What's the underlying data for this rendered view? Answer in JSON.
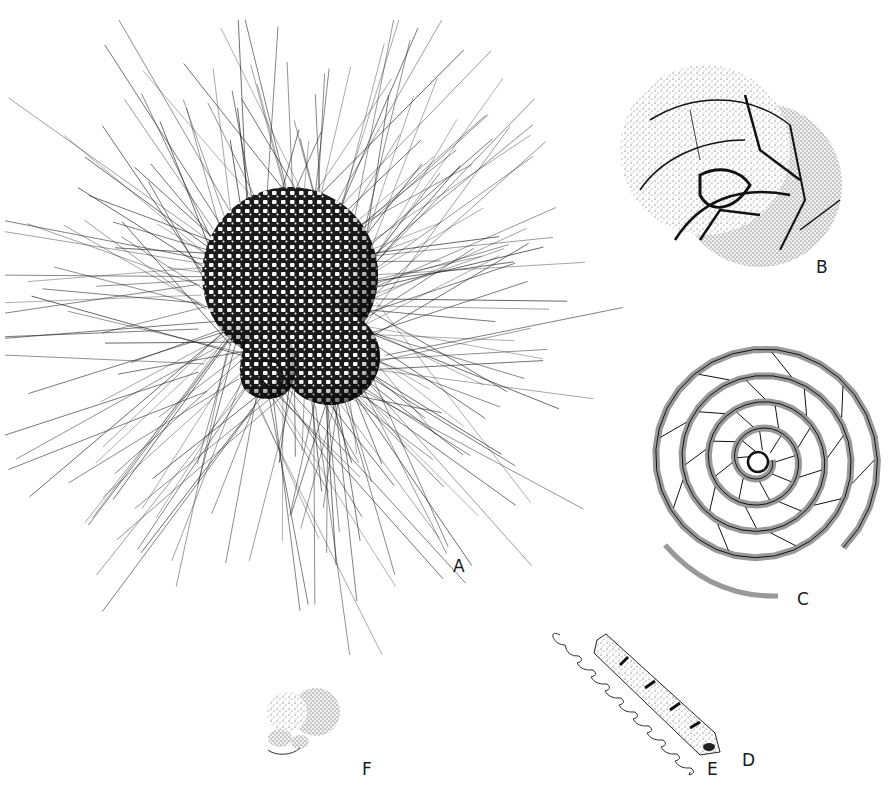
{
  "plate": {
    "description": "Plate of foraminifera illustrations",
    "ink_color": "#1a1a1a",
    "background": "#ffffff"
  },
  "figures": [
    {
      "id": "A",
      "label": "A",
      "subject": "spinose planktonic foraminifer with radiating spines",
      "label_pos": [
        453,
        558
      ]
    },
    {
      "id": "B",
      "label": "B",
      "subject": "trochospiral test, stippled chambers",
      "label_pos": [
        816,
        259
      ]
    },
    {
      "id": "C",
      "label": "C",
      "subject": "planispiral test with many chambers and uncoiling final whorl",
      "label_pos": [
        797,
        591
      ]
    },
    {
      "id": "D",
      "label": "D",
      "subject": "elongate tubular test with apertural neck",
      "label_pos": [
        742,
        752
      ]
    },
    {
      "id": "E",
      "label": "E",
      "subject": "chain-like uniserial test outline",
      "label_pos": [
        707,
        761
      ]
    },
    {
      "id": "F",
      "label": "F",
      "subject": "small globular stippled test",
      "label_pos": [
        362,
        761
      ]
    }
  ]
}
